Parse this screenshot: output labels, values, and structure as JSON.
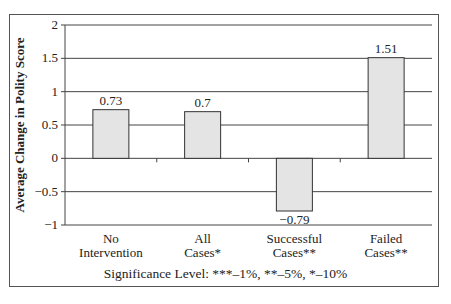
{
  "chart_data": {
    "type": "bar",
    "title": "",
    "xlabel": "",
    "ylabel": "Average Change in Polity Score",
    "categories": [
      "No Intervention",
      "All Cases*",
      "Successful Cases**",
      "Failed Cases**"
    ],
    "category_lines": [
      [
        "No",
        "Intervention"
      ],
      [
        "All",
        "Cases*"
      ],
      [
        "Successful",
        "Cases**"
      ],
      [
        "Failed",
        "Cases**"
      ]
    ],
    "values": [
      0.73,
      0.7,
      -0.79,
      1.51
    ],
    "value_labels": [
      "0.73",
      "0.7",
      "−0.79",
      "1.51"
    ],
    "ylim": [
      -1,
      2
    ],
    "yticks": [
      2,
      1.5,
      1,
      0.5,
      0,
      -0.5,
      -1
    ],
    "ytick_labels": [
      "2",
      "1.5",
      "1",
      "0.5",
      "0",
      "−0.5",
      "−1"
    ],
    "grid": true,
    "bar_color": "#e4e4e4",
    "annotation": "Significance Level: ***–1%, **–5%, *–10%"
  },
  "footer": {
    "note": "Significance Level: ***–1%, **–5%, *–10%"
  }
}
